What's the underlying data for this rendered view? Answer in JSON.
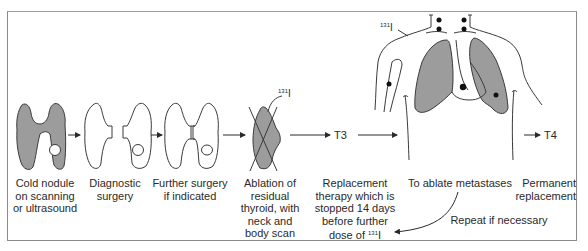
{
  "diagram": {
    "steps": [
      {
        "id": "cold-nodule",
        "label_lines": [
          "Cold nodule",
          "on scanning",
          "or ultrasound"
        ]
      },
      {
        "id": "diagnostic-surgery",
        "label_lines": [
          "Diagnostic",
          "surgery"
        ]
      },
      {
        "id": "further-surgery",
        "label_lines": [
          "Further surgery",
          "if indicated"
        ]
      },
      {
        "id": "ablation",
        "label_lines": [
          "Ablation of",
          "residual",
          "thyroid, with",
          "neck and",
          "body scan"
        ]
      },
      {
        "id": "replacement-therapy",
        "label_lines": [
          "Replacement",
          "therapy which is",
          "stopped 14 days",
          "before further",
          "dose of"
        ]
      },
      {
        "id": "ablate-metastases",
        "label_lines": [
          "To ablate metastases"
        ]
      },
      {
        "id": "permanent-replacement",
        "label_lines": [
          "Permanent",
          "replacement"
        ]
      }
    ],
    "isotope": {
      "mass": "131",
      "symbol": "I"
    },
    "hormones": {
      "t3": "T3",
      "t4": "T4"
    },
    "loop_label": "Repeat if necessary",
    "colors": {
      "fill_gray": "#9c9c9c",
      "stroke": "#3a3a3a",
      "border": "#8a8a8a"
    }
  }
}
